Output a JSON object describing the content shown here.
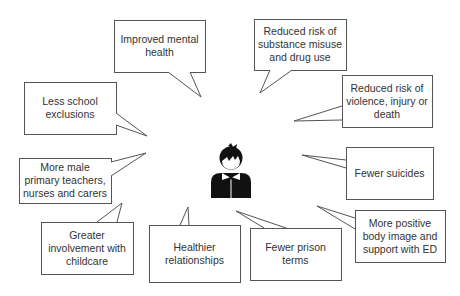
{
  "diagram": {
    "center_icon": "person-with-bowtie-icon",
    "bubbles": [
      {
        "id": "improved-mental-health",
        "text": "Improved mental\nhealth",
        "box": [
          114,
          20,
          91,
          52
        ],
        "tail": [
          [
            168,
            72
          ],
          [
            201,
            97
          ],
          [
            190,
            72
          ]
        ]
      },
      {
        "id": "less-school-exclusions",
        "text": "Less school\nexclusions",
        "box": [
          24,
          82,
          92,
          52
        ],
        "tail": [
          [
            116,
            113
          ],
          [
            147,
            136
          ],
          [
            116,
            125
          ]
        ]
      },
      {
        "id": "reduced-substance-misuse",
        "text": "Reduced risk of\nsubstance misuse\nand drug use",
        "box": [
          254,
          19,
          92,
          51
        ],
        "tail": [
          [
            270,
            70
          ],
          [
            260,
            93
          ],
          [
            292,
            70
          ]
        ]
      },
      {
        "id": "reduced-violence",
        "text": "Reduced risk of\nviolence, injury or\ndeath",
        "box": [
          342,
          75,
          90,
          52
        ],
        "tail": [
          [
            342,
            106
          ],
          [
            294,
            121
          ],
          [
            342,
            120
          ]
        ]
      },
      {
        "id": "fewer-suicides",
        "text": "Fewer suicides",
        "box": [
          346,
          147,
          87,
          52
        ],
        "tail": [
          [
            346,
            160
          ],
          [
            302,
            155
          ],
          [
            346,
            168
          ]
        ]
      },
      {
        "id": "more-male-primary-teachers",
        "text": "More male\nprimary teachers,\nnurses and carers",
        "box": [
          19,
          158,
          92,
          45
        ],
        "tail": [
          [
            111,
            162
          ],
          [
            146,
            153
          ],
          [
            111,
            176
          ]
        ]
      },
      {
        "id": "more-positive-body-image",
        "text": "More positive\nbody image and\nsupport with ED",
        "box": [
          355,
          210,
          90,
          52
        ],
        "tail": [
          [
            355,
            218
          ],
          [
            317,
            206
          ],
          [
            355,
            229
          ]
        ]
      },
      {
        "id": "greater-childcare-involvement",
        "text": "Greater\ninvolvement with\nchildcare",
        "box": [
          41,
          222,
          92,
          52
        ],
        "tail": [
          [
            97,
            222
          ],
          [
            122,
            203
          ],
          [
            117,
            222
          ]
        ]
      },
      {
        "id": "healthier-relationships",
        "text": "Healthier\nrelationships",
        "box": [
          149,
          225,
          91,
          57
        ],
        "tail": [
          [
            180,
            225
          ],
          [
            188,
            207
          ],
          [
            189,
            225
          ]
        ]
      },
      {
        "id": "fewer-prison-terms",
        "text": "Fewer prison\nterms",
        "box": [
          250,
          228,
          91,
          52
        ],
        "tail": [
          [
            264,
            228
          ],
          [
            236,
            211
          ],
          [
            286,
            228
          ]
        ]
      }
    ]
  },
  "colors": {
    "stroke": "#555555",
    "fill": "#ffffff",
    "icon": "#111111",
    "text": "#333333"
  }
}
